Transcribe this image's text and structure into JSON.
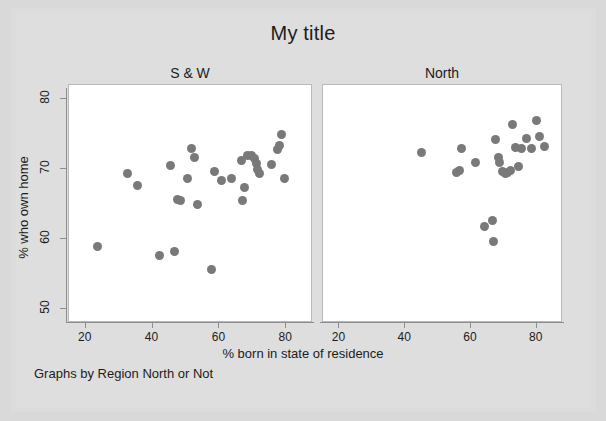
{
  "title": "My title",
  "xlabel": "% born in state of residence",
  "ylabel": "% who own home",
  "footnote": "Graphs by Region North or Not",
  "panels": [
    {
      "name": "S & W"
    },
    {
      "name": "North"
    }
  ],
  "ticks": {
    "x": [
      "20",
      "40",
      "60",
      "80"
    ],
    "y": [
      "50",
      "60",
      "70",
      "80"
    ]
  },
  "colors": {
    "marker": "#797979",
    "figure_background": "#dedede",
    "plot_background": "#ffffff",
    "axis": "#8d8d8d",
    "text": "#1c1c1c"
  },
  "chart_data": {
    "type": "scatter",
    "title": "My title",
    "xlabel": "% born in state of residence",
    "ylabel": "% who own home",
    "footnote": "Graphs by Region North or Not",
    "xlim": [
      15,
      88
    ],
    "ylim": [
      48,
      82
    ],
    "xticks": [
      20,
      40,
      60,
      80
    ],
    "yticks": [
      50,
      60,
      70,
      80
    ],
    "grid": false,
    "legend": null,
    "panels": [
      {
        "name": "S & W",
        "points": [
          {
            "x": 23.5,
            "y": 59.0
          },
          {
            "x": 32.5,
            "y": 69.3
          },
          {
            "x": 35.5,
            "y": 67.6
          },
          {
            "x": 42.0,
            "y": 57.7
          },
          {
            "x": 45.5,
            "y": 70.5
          },
          {
            "x": 46.5,
            "y": 58.2
          },
          {
            "x": 47.5,
            "y": 65.7
          },
          {
            "x": 48.5,
            "y": 65.5
          },
          {
            "x": 50.5,
            "y": 68.7
          },
          {
            "x": 51.5,
            "y": 72.9
          },
          {
            "x": 52.5,
            "y": 71.7
          },
          {
            "x": 53.5,
            "y": 65.0
          },
          {
            "x": 57.5,
            "y": 55.7
          },
          {
            "x": 58.5,
            "y": 69.7
          },
          {
            "x": 60.5,
            "y": 68.3
          },
          {
            "x": 63.5,
            "y": 68.6
          },
          {
            "x": 66.5,
            "y": 71.2
          },
          {
            "x": 67.0,
            "y": 65.5
          },
          {
            "x": 67.5,
            "y": 67.4
          },
          {
            "x": 68.5,
            "y": 71.9
          },
          {
            "x": 69.5,
            "y": 72.0
          },
          {
            "x": 70.5,
            "y": 71.5
          },
          {
            "x": 71.0,
            "y": 70.8
          },
          {
            "x": 71.5,
            "y": 70.0
          },
          {
            "x": 72.0,
            "y": 69.4
          },
          {
            "x": 75.5,
            "y": 70.6
          },
          {
            "x": 77.5,
            "y": 72.8
          },
          {
            "x": 78.0,
            "y": 73.4
          },
          {
            "x": 78.5,
            "y": 74.9
          },
          {
            "x": 79.5,
            "y": 68.6
          }
        ]
      },
      {
        "name": "North",
        "points": [
          {
            "x": 45.0,
            "y": 72.4
          },
          {
            "x": 55.5,
            "y": 69.5
          },
          {
            "x": 56.5,
            "y": 69.8
          },
          {
            "x": 57.0,
            "y": 72.9
          },
          {
            "x": 61.5,
            "y": 71.0
          },
          {
            "x": 64.0,
            "y": 61.8
          },
          {
            "x": 66.5,
            "y": 62.6
          },
          {
            "x": 67.0,
            "y": 59.7
          },
          {
            "x": 67.5,
            "y": 74.2
          },
          {
            "x": 68.5,
            "y": 71.6
          },
          {
            "x": 68.8,
            "y": 70.9
          },
          {
            "x": 69.5,
            "y": 69.6
          },
          {
            "x": 70.5,
            "y": 69.4
          },
          {
            "x": 71.0,
            "y": 69.5
          },
          {
            "x": 72.0,
            "y": 69.8
          },
          {
            "x": 72.5,
            "y": 76.4
          },
          {
            "x": 73.5,
            "y": 73.1
          },
          {
            "x": 74.5,
            "y": 70.4
          },
          {
            "x": 75.5,
            "y": 72.9
          },
          {
            "x": 77.0,
            "y": 74.3
          },
          {
            "x": 78.5,
            "y": 73.0
          },
          {
            "x": 80.0,
            "y": 77.0
          },
          {
            "x": 81.0,
            "y": 74.7
          },
          {
            "x": 82.5,
            "y": 73.2
          }
        ]
      }
    ]
  }
}
